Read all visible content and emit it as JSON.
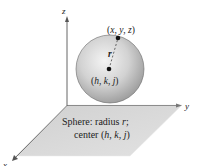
{
  "diagram": {
    "type": "3d-sphere-in-coordinate-space",
    "axes": {
      "x_label": "x",
      "y_label": "y",
      "z_label": "z"
    },
    "points": {
      "surface_point_label": "(x, y, z)",
      "center_label": "(h, k, j)",
      "radius_label": "r"
    },
    "caption": {
      "line1_prefix": "Sphere: radius ",
      "line1_var": "r",
      "line1_suffix": ";",
      "line2_prefix": "center (",
      "line2_h": "h",
      "line2_sep1": ", ",
      "line2_k": "k",
      "line2_sep2": ", ",
      "line2_j": "j",
      "line2_suffix": ")"
    },
    "colors": {
      "plane": "#d4d4d4",
      "sphere_light": "#f2f2f2",
      "sphere_dark": "#9a9a9a",
      "axis": "#555555",
      "point": "#111111"
    }
  }
}
